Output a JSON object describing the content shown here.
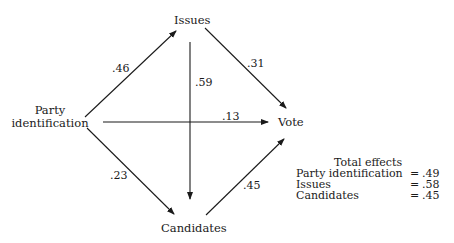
{
  "diagram": {
    "type": "path-diagram",
    "nodes": {
      "party": {
        "line1": "Party",
        "line2": "identification"
      },
      "issues": {
        "label": "Issues"
      },
      "candidates": {
        "label": "Candidates"
      },
      "vote": {
        "label": "Vote"
      }
    },
    "paths": [
      {
        "from": "Party identification",
        "to": "Issues",
        "coefficient": ".46"
      },
      {
        "from": "Party identification",
        "to": "Candidates",
        "coefficient": ".23"
      },
      {
        "from": "Party identification",
        "to": "Vote",
        "coefficient": ".13"
      },
      {
        "from": "Issues",
        "to": "Candidates",
        "coefficient": ".59"
      },
      {
        "from": "Issues",
        "to": "Vote",
        "coefficient": ".31"
      },
      {
        "from": "Candidates",
        "to": "Vote",
        "coefficient": ".45"
      }
    ],
    "coefficients": {
      "party_issues": ".46",
      "party_candidates": ".23",
      "party_vote": ".13",
      "issues_candidates": ".59",
      "issues_vote": ".31",
      "candidates_vote": ".45"
    },
    "total_effects": {
      "title": "Total effects",
      "rows": [
        {
          "label": "Party identification",
          "eq": "=",
          "value": ".49"
        },
        {
          "label": "Issues",
          "eq": "=",
          "value": ".58"
        },
        {
          "label": "Candidates",
          "eq": "=",
          "value": ".45"
        }
      ]
    },
    "colors": {
      "line": "#1a1a1a",
      "background": "#ffffff"
    }
  }
}
